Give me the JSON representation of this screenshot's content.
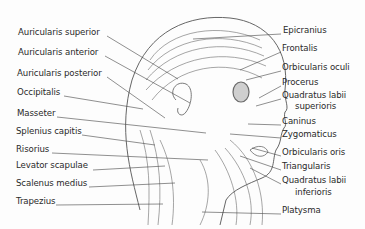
{
  "left_labels": [
    {
      "text": "Auricularis superior",
      "x": 18,
      "y": 32
    },
    {
      "text": "Auricularis anterior",
      "x": 18,
      "y": 52
    },
    {
      "text": "Auricularis posterior",
      "x": 17,
      "y": 73
    },
    {
      "text": "Occipitalis",
      "x": 17,
      "y": 92
    },
    {
      "text": "Masseter",
      "x": 17,
      "y": 113
    },
    {
      "text": "Splenius capitis",
      "x": 16,
      "y": 131
    },
    {
      "text": "Risorius",
      "x": 16,
      "y": 149
    },
    {
      "text": "Levator scapulae",
      "x": 16,
      "y": 165
    },
    {
      "text": "Scalenus medius",
      "x": 16,
      "y": 183
    },
    {
      "text": "Trapezius",
      "x": 16,
      "y": 201
    }
  ],
  "right_labels": [
    {
      "text": "Epicranius",
      "x": 283,
      "y": 30
    },
    {
      "text": "Frontalis",
      "x": 282,
      "y": 48
    },
    {
      "text": "Orbicularis oculi",
      "x": 282,
      "y": 67
    },
    {
      "text": "Procerus",
      "x": 282,
      "y": 82
    },
    {
      "text": "Quadratus labii",
      "x": 282,
      "y": 95
    },
    {
      "text": "superioris",
      "x": 295,
      "y": 106
    },
    {
      "text": "Caninus",
      "x": 282,
      "y": 121
    },
    {
      "text": "Zygomaticus",
      "x": 282,
      "y": 134
    },
    {
      "text": "Orbicularis oris",
      "x": 282,
      "y": 152
    },
    {
      "text": "Triangularis",
      "x": 282,
      "y": 166
    },
    {
      "text": "Quadratus labii",
      "x": 282,
      "y": 180
    },
    {
      "text": "inferioris",
      "x": 295,
      "y": 192
    },
    {
      "text": "Platysma",
      "x": 282,
      "y": 210
    }
  ]
}
